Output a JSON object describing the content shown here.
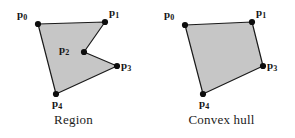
{
  "figure": {
    "background_color": "#ffffff",
    "fill_color": "#c6c6c6",
    "stroke_color": "#1a1a1a",
    "vertex_color": "#0d0d0d",
    "panels": [
      {
        "id": "region",
        "caption": "Region",
        "polygon_type": "non-convex-polygon",
        "points": [
          {
            "label": "p",
            "sub": "0",
            "x": 38,
            "y": 24,
            "label_x": 17,
            "label_y": 9
          },
          {
            "label": "p",
            "sub": "1",
            "x": 105,
            "y": 22,
            "label_x": 109,
            "label_y": 7
          },
          {
            "label": "p",
            "sub": "2",
            "x": 84,
            "y": 52,
            "label_x": 59,
            "label_y": 44
          },
          {
            "label": "p",
            "sub": "3",
            "x": 117,
            "y": 66,
            "label_x": 121,
            "label_y": 60
          },
          {
            "label": "p",
            "sub": "4",
            "x": 56,
            "y": 94,
            "label_x": 52,
            "label_y": 98
          }
        ],
        "path_order": [
          "p0",
          "p1",
          "p2",
          "p3",
          "p4"
        ]
      },
      {
        "id": "convex-hull",
        "caption": "Convex hull",
        "polygon_type": "convex-polygon",
        "points": [
          {
            "label": "p",
            "sub": "0",
            "x": 37,
            "y": 25,
            "label_x": 16,
            "label_y": 9
          },
          {
            "label": "p",
            "sub": "1",
            "x": 104,
            "y": 22,
            "label_x": 108,
            "label_y": 7
          },
          {
            "label": "p",
            "sub": "3",
            "x": 115,
            "y": 66,
            "label_x": 119,
            "label_y": 60
          },
          {
            "label": "p",
            "sub": "4",
            "x": 55,
            "y": 94,
            "label_x": 51,
            "label_y": 98
          }
        ],
        "path_order": [
          "p0",
          "p1",
          "p3",
          "p4"
        ]
      }
    ]
  }
}
